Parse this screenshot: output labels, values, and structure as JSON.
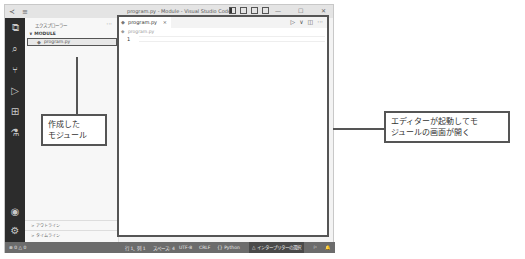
{
  "window": {
    "title": "program.py - Module - Visual Studio Code",
    "controls": {
      "minimize": "—",
      "maximize": "☐",
      "close": "✕"
    }
  },
  "activity_bar": {
    "items": [
      {
        "name": "explorer",
        "glyph": "⧉"
      },
      {
        "name": "search",
        "glyph": "⌕"
      },
      {
        "name": "source-control",
        "glyph": "⑂"
      },
      {
        "name": "run-debug",
        "glyph": "▷"
      },
      {
        "name": "extensions",
        "glyph": "⊞"
      },
      {
        "name": "testing",
        "glyph": "⚗"
      }
    ],
    "bottom": [
      {
        "name": "account",
        "glyph": "◉"
      },
      {
        "name": "settings",
        "glyph": "⚙"
      }
    ]
  },
  "sidebar": {
    "title": "エクスプローラー",
    "more": "···",
    "section": "∨ MODULE",
    "file": "program.py",
    "outline": "> アウトライン",
    "timeline": "> タイムライン"
  },
  "editor": {
    "tab_label": "program.py",
    "tab_close": "×",
    "breadcrumb": "program.py",
    "line_number": "1",
    "actions": {
      "run": "▷",
      "run_menu": "∨",
      "split": "◫",
      "more": "···"
    }
  },
  "status_bar": {
    "problems": "⊗ 0 △ 0",
    "position": "行 1、列 1",
    "spaces": "スペース: 4",
    "encoding": "UTF-8",
    "eol": "CRLF",
    "language": "{} Python",
    "interpreter": "△ インタープリターの選択",
    "feedback": "⚐",
    "notifications": "🔔"
  },
  "annotations": {
    "left_callout": [
      "作成した",
      "モジュール"
    ],
    "right_callout": [
      "エディターが起動してモ",
      "ジュールの画面が開く"
    ]
  }
}
